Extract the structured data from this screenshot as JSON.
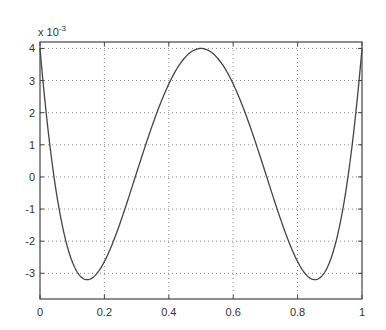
{
  "chart_data": {
    "type": "line",
    "title": "",
    "xlabel": "",
    "ylabel": "",
    "y_scale_label": "x 10",
    "y_scale_exponent": "-3",
    "xlim": [
      0,
      1
    ],
    "ylim": [
      -3.8,
      4.2
    ],
    "grid": true,
    "grid_style": "dotted",
    "x_ticks": [
      0,
      0.2,
      0.4,
      0.6,
      0.8,
      1
    ],
    "x_tick_labels": [
      "0",
      "0.2",
      "0.4",
      "0.6",
      "0.8",
      "1"
    ],
    "y_ticks": [
      -3,
      -2,
      -1,
      0,
      1,
      2,
      3,
      4
    ],
    "y_tick_labels": [
      "-3",
      "-2",
      "-1",
      "0",
      "1",
      "2",
      "3",
      "4"
    ],
    "series": [
      {
        "name": "curve",
        "color": "#444444",
        "description": "3.6*T4(2x-1)+0.4 (x 10^-3)",
        "x": [
          0,
          0.05,
          0.1,
          0.146,
          0.2,
          0.25,
          0.3,
          0.35,
          0.4,
          0.45,
          0.5,
          0.55,
          0.6,
          0.65,
          0.7,
          0.75,
          0.8,
          0.854,
          0.9,
          0.95,
          1
        ],
        "y": [
          4.0,
          0.64,
          -2.18,
          -3.2,
          -2.58,
          -1.4,
          0.42,
          2.02,
          3.43,
          3.96,
          4.0,
          3.96,
          3.43,
          2.02,
          0.42,
          -1.4,
          -2.58,
          -3.2,
          -2.18,
          0.64,
          4.0
        ]
      }
    ]
  },
  "colors": {
    "axis": "#444444",
    "grid": "#888888",
    "line": "#444444",
    "text": "#333333"
  }
}
